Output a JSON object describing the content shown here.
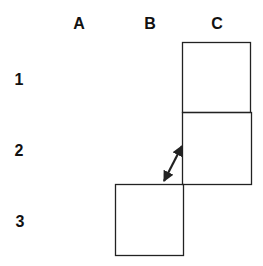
{
  "columns": [
    {
      "label": "A",
      "x": 79,
      "y": 24
    },
    {
      "label": "B",
      "x": 150,
      "y": 24
    },
    {
      "label": "C",
      "x": 217,
      "y": 24
    }
  ],
  "rows": [
    {
      "label": "1",
      "x": 19,
      "y": 80
    },
    {
      "label": "2",
      "x": 19,
      "y": 151
    },
    {
      "label": "3",
      "x": 20,
      "y": 222
    }
  ],
  "cells": [
    {
      "id": "C1",
      "x": 182,
      "y": 42,
      "w": 68,
      "h": 70
    },
    {
      "id": "C2",
      "x": 182,
      "y": 112,
      "w": 69,
      "h": 72
    },
    {
      "id": "B3",
      "x": 115,
      "y": 184,
      "w": 68,
      "h": 71
    }
  ],
  "arrow": {
    "type": "double-headed",
    "from": [
      163,
      183
    ],
    "to": [
      183,
      144
    ]
  },
  "colors": {
    "stroke": "#222222",
    "background": "#ffffff"
  }
}
